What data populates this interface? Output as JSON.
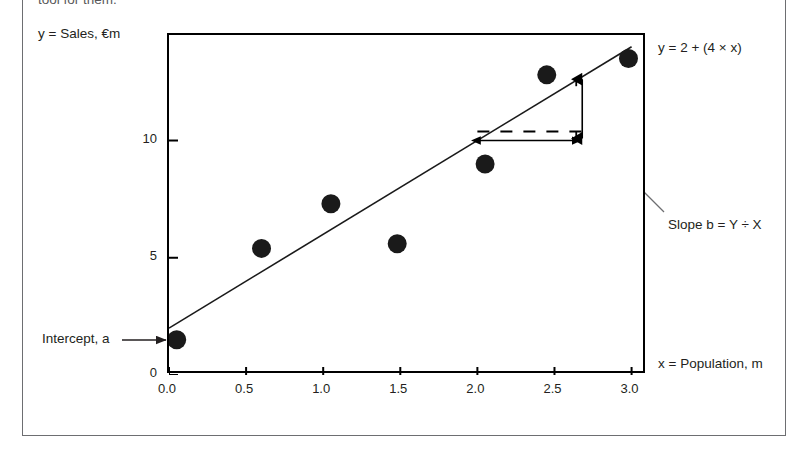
{
  "figure": {
    "caption_top": "tool for them.",
    "y_axis_label": "y = Sales, €m",
    "x_axis_label": "x = Population, m",
    "equation_label": "y = 2 + (4 × x)",
    "slope_label": "Slope b = Y ÷ X",
    "intercept_label": "Intercept, a",
    "rise_letter": "Y",
    "run_letter": "X"
  },
  "chart_data": {
    "type": "scatter",
    "title": "",
    "subtitle": "",
    "xlabel": "x = Population, m",
    "ylabel": "y = Sales, €m",
    "xlim": [
      0.0,
      3.1
    ],
    "ylim": [
      0.0,
      14.5
    ],
    "grid": false,
    "legend": null,
    "xticks": [
      0.0,
      0.5,
      1.0,
      1.5,
      2.0,
      2.5,
      3.0
    ],
    "xtick_labels": [
      "0.0",
      "0.5",
      "1.0",
      "1.5",
      "2.0",
      "2.5",
      "3.0"
    ],
    "yticks": [
      0,
      5,
      10
    ],
    "ytick_labels": [
      "0",
      "5",
      "10"
    ],
    "series": [
      {
        "name": "Observed sales",
        "type": "scatter",
        "marker": "filled-circle",
        "color": "#1a1a1a",
        "points": [
          {
            "x": 0.05,
            "y": 1.5
          },
          {
            "x": 0.6,
            "y": 5.4
          },
          {
            "x": 1.05,
            "y": 7.3
          },
          {
            "x": 1.48,
            "y": 5.6
          },
          {
            "x": 2.05,
            "y": 9.0
          },
          {
            "x": 2.45,
            "y": 12.8
          },
          {
            "x": 2.98,
            "y": 13.5
          }
        ]
      },
      {
        "name": "Regression line y = 2 + (4 × x)",
        "type": "line",
        "color": "#1a1a1a",
        "intercept": 2,
        "slope": 4,
        "x_from": 0.0,
        "x_to": 3.0
      }
    ],
    "annotations": [
      {
        "name": "intercept-callout",
        "text": "Intercept, a",
        "points_to": {
          "x": 0.0,
          "y": 2.0
        }
      },
      {
        "name": "slope-callout",
        "text": "Slope b = Y ÷ X",
        "points_to": {
          "x": 2.68,
          "y": 10.0
        }
      },
      {
        "name": "rise-measure",
        "text": "Y",
        "from": {
          "x": 2.68,
          "y": 10.0
        },
        "to": {
          "x": 2.68,
          "y": 12.7
        }
      },
      {
        "name": "run-measure",
        "text": "X",
        "from": {
          "x": 2.0,
          "y": 10.0
        },
        "to": {
          "x": 2.68,
          "y": 10.0
        }
      },
      {
        "name": "equation",
        "text": "y = 2 + (4 × x)"
      }
    ]
  }
}
